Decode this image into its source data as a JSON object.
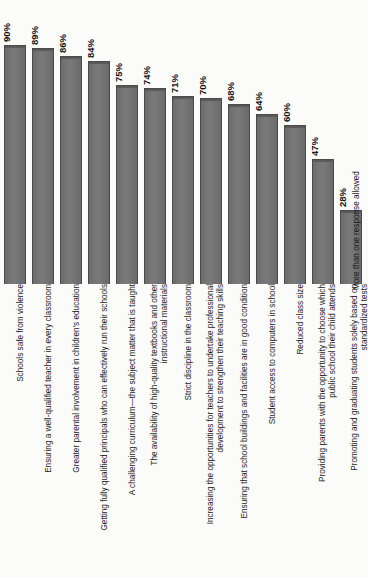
{
  "chart_data": {
    "type": "bar",
    "title": "",
    "xlabel": "",
    "ylabel": "",
    "ylim": [
      0,
      100
    ],
    "grid": false,
    "legend": null,
    "orientation": "vertical-bars-rotated-page",
    "value_suffix": "%",
    "footnote": "More than one response allowed",
    "categories": [
      "Schools safe from violence",
      "Ensuring a well-qualified teacher in every classroom",
      "Greater parental involvement in children's education",
      "Getting fully qualified principals who can effectively run their schools",
      "A challenging curriculum—the subject matter that is taught",
      "The availability of high-quality textbooks and other instructional materials",
      "Strict discipline in the classroom",
      "Increasing the opportunities for teachers to undertake professional development to strengthen their teaching skills",
      "Ensuring that school buildings and facilities are in good condition",
      "Student access to computers in school",
      "Reduced class size",
      "Providing parents with the opportunity to choose which public school their child attends",
      "Promoting and graduating students solely based on standardized tests"
    ],
    "category_lines": [
      [
        "Schools safe from violence"
      ],
      [
        "Ensuring a well-qualified teacher in every classroom"
      ],
      [
        "Greater parental involvement in children's education"
      ],
      [
        "Getting fully qualified principals who can effectively run their schools"
      ],
      [
        "A challenging curriculum—the subject matter that is taught"
      ],
      [
        "The availability of high-quality textbooks and other",
        "instructional materials"
      ],
      [
        "Strict discipline in the classroom"
      ],
      [
        "Increasing the opportunities for teachers to undertake professional",
        "development to strengthen their teaching skills"
      ],
      [
        "Ensuring that school buildings and facilities are in good condition"
      ],
      [
        "Student access to computers in school"
      ],
      [
        "Reduced class size"
      ],
      [
        "Providing parents with the opportunity to choose which",
        "public school their child attends"
      ],
      [
        "Promoting and graduating students solely based on",
        "standardized tests"
      ]
    ],
    "values": [
      90,
      89,
      86,
      84,
      75,
      74,
      71,
      70,
      68,
      64,
      60,
      47,
      28
    ],
    "value_labels": [
      "90%",
      "89%",
      "86%",
      "84%",
      "75%",
      "74%",
      "71%",
      "70%",
      "68%",
      "64%",
      "60%",
      "47%",
      "28%"
    ],
    "colors": {
      "bar_fill": "#707070",
      "bar_edge": "#4a4a4a",
      "background": "#fbfbfa",
      "text": "#1b1b1b"
    }
  }
}
